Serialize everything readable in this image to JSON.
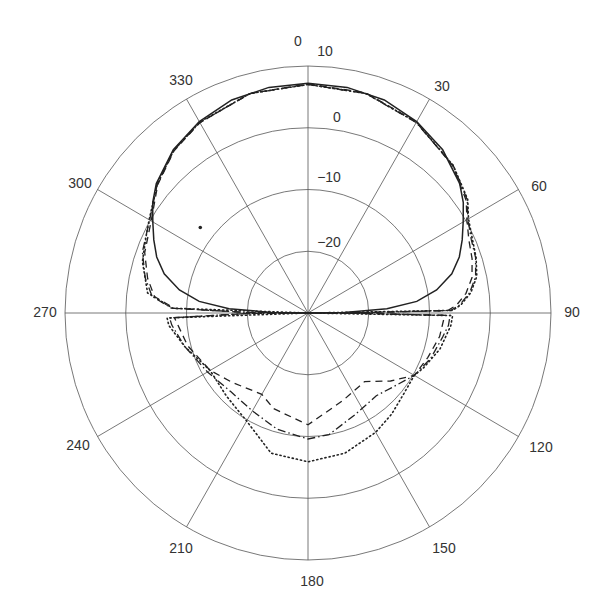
{
  "chart_data": {
    "type": "polar",
    "title": "",
    "angle_direction": "clockwise",
    "angle_zero": "top",
    "angle_ticks": [
      0,
      30,
      60,
      90,
      120,
      150,
      180,
      210,
      240,
      270,
      300,
      330
    ],
    "angle_tick_labels": [
      "0",
      "30",
      "60",
      "90",
      "120",
      "150",
      "180",
      "210",
      "240",
      "270",
      "300",
      "330"
    ],
    "radial_range": [
      -30,
      10
    ],
    "radial_ticks": [
      -20,
      -10,
      0,
      10
    ],
    "radial_tick_labels": [
      "−20",
      "−10",
      "0",
      "10"
    ],
    "grid": true,
    "legend": null,
    "series": [
      {
        "name": "solid",
        "style": "solid",
        "points": [
          [
            0,
            7.2
          ],
          [
            10,
            7.1
          ],
          [
            20,
            6.7
          ],
          [
            30,
            5.8
          ],
          [
            40,
            4.5
          ],
          [
            50,
            2.6
          ],
          [
            55,
            1.2
          ],
          [
            60,
            -0.5
          ],
          [
            65,
            -2
          ],
          [
            70,
            -3.5
          ],
          [
            75,
            -5.5
          ],
          [
            80,
            -8.5
          ],
          [
            84,
            -12
          ],
          [
            87,
            -17
          ],
          [
            89,
            -24
          ],
          [
            90,
            -30
          ],
          [
            270,
            -30
          ],
          [
            271,
            -24
          ],
          [
            273,
            -17
          ],
          [
            276,
            -12
          ],
          [
            280,
            -8.5
          ],
          [
            285,
            -5.5
          ],
          [
            290,
            -3.5
          ],
          [
            295,
            -2
          ],
          [
            300,
            -0.5
          ],
          [
            305,
            1.2
          ],
          [
            310,
            2.6
          ],
          [
            320,
            4.5
          ],
          [
            330,
            5.8
          ],
          [
            340,
            6.7
          ],
          [
            350,
            7.1
          ],
          [
            360,
            7.2
          ]
        ]
      },
      {
        "name": "dash-dot",
        "style": "dashdot",
        "points": [
          [
            0,
            7
          ],
          [
            15,
            6.8
          ],
          [
            30,
            5.6
          ],
          [
            45,
            3.8
          ],
          [
            55,
            2
          ],
          [
            60,
            0.4
          ],
          [
            66,
            -0.6
          ],
          [
            72,
            -1
          ],
          [
            78,
            -1.8
          ],
          [
            83,
            -3.2
          ],
          [
            87,
            -5
          ],
          [
            89,
            -6.5
          ],
          [
            89.5,
            -20
          ],
          [
            90,
            -30
          ],
          [
            90.5,
            -20
          ],
          [
            91,
            -6.6
          ],
          [
            95,
            -6.8
          ],
          [
            100,
            -7.5
          ],
          [
            110,
            -8.5
          ],
          [
            120,
            -9.8
          ],
          [
            130,
            -11.5
          ],
          [
            140,
            -12.5
          ],
          [
            155,
            -11.8
          ],
          [
            170,
            -10
          ],
          [
            180,
            -9.6
          ],
          [
            195,
            -10.5
          ],
          [
            210,
            -11.7
          ],
          [
            225,
            -12
          ],
          [
            240,
            -10.9
          ],
          [
            255,
            -9
          ],
          [
            265,
            -7.5
          ],
          [
            268,
            -7.2
          ],
          [
            269.5,
            -20
          ],
          [
            270,
            -30
          ],
          [
            270.5,
            -20
          ],
          [
            272,
            -7.5
          ],
          [
            276,
            -4.2
          ],
          [
            282,
            -2.6
          ],
          [
            290,
            -1
          ],
          [
            300,
            0.1
          ],
          [
            310,
            2.4
          ],
          [
            320,
            4.4
          ],
          [
            330,
            5.6
          ],
          [
            345,
            6.8
          ],
          [
            360,
            7
          ]
        ]
      },
      {
        "name": "dotted",
        "style": "dotted",
        "points": [
          [
            0,
            7
          ],
          [
            15,
            6.8
          ],
          [
            30,
            5.7
          ],
          [
            45,
            3.8
          ],
          [
            55,
            2.1
          ],
          [
            60,
            0.5
          ],
          [
            66,
            -0.4
          ],
          [
            72,
            -0.9
          ],
          [
            78,
            -1.6
          ],
          [
            83,
            -3
          ],
          [
            87,
            -4.8
          ],
          [
            89,
            -6.2
          ],
          [
            90,
            -30
          ],
          [
            91,
            -6.2
          ],
          [
            95,
            -6.4
          ],
          [
            105,
            -7.5
          ],
          [
            115,
            -9
          ],
          [
            120,
            -9.8
          ],
          [
            130,
            -9.5
          ],
          [
            140,
            -8.6
          ],
          [
            150,
            -7.7
          ],
          [
            165,
            -6.5
          ],
          [
            180,
            -5.9
          ],
          [
            195,
            -6.5
          ],
          [
            210,
            -9.8
          ],
          [
            225,
            -11
          ],
          [
            240,
            -11.4
          ],
          [
            255,
            -9
          ],
          [
            265,
            -7
          ],
          [
            268,
            -6.8
          ],
          [
            270,
            -30
          ],
          [
            272,
            -7.7
          ],
          [
            277,
            -3.4
          ],
          [
            287,
            -1.5
          ],
          [
            295,
            -0.6
          ],
          [
            300,
            0.2
          ],
          [
            310,
            2.4
          ],
          [
            320,
            4.4
          ],
          [
            330,
            5.7
          ],
          [
            345,
            6.8
          ],
          [
            360,
            7
          ]
        ]
      },
      {
        "name": "dashed",
        "style": "dashed",
        "points": [
          [
            0,
            7.1
          ],
          [
            15,
            6.9
          ],
          [
            30,
            5.7
          ],
          [
            45,
            3.7
          ],
          [
            55,
            1.8
          ],
          [
            60,
            0.2
          ],
          [
            66,
            -1
          ],
          [
            72,
            -1.6
          ],
          [
            78,
            -2.4
          ],
          [
            83,
            -3.8
          ],
          [
            87,
            -5.5
          ],
          [
            89,
            -7
          ],
          [
            89.5,
            -20
          ],
          [
            90,
            -30
          ],
          [
            90.5,
            -20
          ],
          [
            91,
            -7.5
          ],
          [
            100,
            -8
          ],
          [
            110,
            -9
          ],
          [
            120,
            -9.8
          ],
          [
            129,
            -12.5
          ],
          [
            140,
            -15.5
          ],
          [
            158,
            -14.7
          ],
          [
            180,
            -11.9
          ],
          [
            200,
            -13.5
          ],
          [
            210,
            -14.8
          ],
          [
            228,
            -13.2
          ],
          [
            240,
            -11.4
          ],
          [
            255,
            -9.5
          ],
          [
            268,
            -8
          ],
          [
            269.5,
            -20
          ],
          [
            270,
            -30
          ],
          [
            270.5,
            -20
          ],
          [
            272,
            -8
          ],
          [
            276,
            -4.6
          ],
          [
            282,
            -3
          ],
          [
            290,
            -1.4
          ],
          [
            300,
            -0.2
          ],
          [
            310,
            2.3
          ],
          [
            320,
            4.3
          ],
          [
            330,
            5.6
          ],
          [
            345,
            6.8
          ],
          [
            360,
            7.1
          ]
        ]
      }
    ],
    "annotations": [
      {
        "type": "point",
        "angle": 308,
        "value": -7.5
      }
    ]
  },
  "labels": {
    "angles": [
      {
        "text": "0",
        "x": 298,
        "y": 41
      },
      {
        "text": "30",
        "x": 442,
        "y": 86
      },
      {
        "text": "60",
        "x": 539,
        "y": 186
      },
      {
        "text": "90",
        "x": 572,
        "y": 312
      },
      {
        "text": "120",
        "x": 541,
        "y": 447
      },
      {
        "text": "150",
        "x": 444,
        "y": 548
      },
      {
        "text": "180",
        "x": 312,
        "y": 581
      },
      {
        "text": "210",
        "x": 181,
        "y": 548
      },
      {
        "text": "240",
        "x": 78,
        "y": 445
      },
      {
        "text": "270",
        "x": 45,
        "y": 312
      },
      {
        "text": "300",
        "x": 80,
        "y": 183
      },
      {
        "text": "330",
        "x": 181,
        "y": 80
      }
    ],
    "radial": [
      {
        "text": "10",
        "x": 325,
        "y": 51
      },
      {
        "text": "0",
        "x": 337,
        "y": 117
      },
      {
        "text": "−10",
        "x": 329,
        "y": 177
      },
      {
        "text": "−20",
        "x": 329,
        "y": 242
      }
    ]
  },
  "style": {
    "grid_color": "#555555",
    "curve_color": "#222222",
    "label_color": "#333333"
  }
}
